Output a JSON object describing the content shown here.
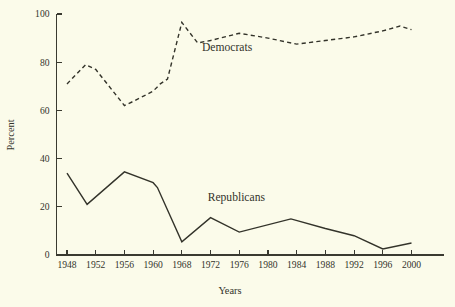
{
  "chart_data": {
    "type": "line",
    "title": "",
    "xlabel": "Years",
    "ylabel": "Percent",
    "ylim": [
      0,
      100
    ],
    "yticks": [
      0,
      20,
      40,
      60,
      80,
      100
    ],
    "ytick_labels": [
      "0",
      "20",
      "40",
      "60",
      "80",
      "100"
    ],
    "categories": [
      "1948",
      "1952",
      "1956",
      "1960",
      "1968",
      "1972",
      "1976",
      "1980",
      "1984",
      "1988",
      "1992",
      "1996",
      "2000"
    ],
    "xtick_labels": [
      "1948",
      "1952",
      "1956",
      "1960",
      "1968",
      "1972",
      "1976",
      "1980",
      "1984",
      "1988",
      "1992",
      "1996",
      "2000"
    ],
    "grid": false,
    "legend_position": "inline-annotations",
    "series": [
      {
        "name": "Democrats",
        "style": "dashed",
        "color": "#33332a",
        "label_x": 1970.8,
        "label_y": 84.5,
        "points": [
          {
            "x": 1948,
            "y": 71
          },
          {
            "x": 1950.6,
            "y": 79
          },
          {
            "x": 1952,
            "y": 77
          },
          {
            "x": 1956,
            "y": 62
          },
          {
            "x": 1957.4,
            "y": 64
          },
          {
            "x": 1960,
            "y": 68
          },
          {
            "x": 1962,
            "y": 71
          },
          {
            "x": 1964,
            "y": 73
          },
          {
            "x": 1968,
            "y": 96.5
          },
          {
            "x": 1970.2,
            "y": 88
          },
          {
            "x": 1972,
            "y": 89
          },
          {
            "x": 1976,
            "y": 92
          },
          {
            "x": 1980,
            "y": 90
          },
          {
            "x": 1984,
            "y": 87.5
          },
          {
            "x": 1988,
            "y": 89
          },
          {
            "x": 1992,
            "y": 90.5
          },
          {
            "x": 1996,
            "y": 93
          },
          {
            "x": 1998.4,
            "y": 95
          },
          {
            "x": 2000,
            "y": 93.5
          }
        ]
      },
      {
        "name": "Republicans",
        "style": "solid",
        "color": "#33332a",
        "label_x": 1971.6,
        "label_y": 22.5,
        "points": [
          {
            "x": 1948,
            "y": 34
          },
          {
            "x": 1950.8,
            "y": 21
          },
          {
            "x": 1956,
            "y": 34.5
          },
          {
            "x": 1960,
            "y": 30
          },
          {
            "x": 1961.2,
            "y": 28
          },
          {
            "x": 1968,
            "y": 5.5
          },
          {
            "x": 1972,
            "y": 15.5
          },
          {
            "x": 1976,
            "y": 9.5
          },
          {
            "x": 1983.2,
            "y": 15
          },
          {
            "x": 1988,
            "y": 11
          },
          {
            "x": 1992,
            "y": 8
          },
          {
            "x": 1996,
            "y": 2.5
          },
          {
            "x": 2000,
            "y": 5
          }
        ]
      }
    ]
  }
}
